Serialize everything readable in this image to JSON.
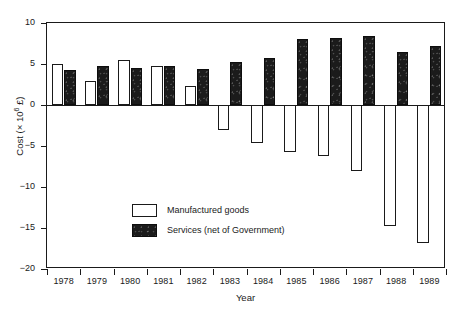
{
  "chart_data": {
    "type": "bar",
    "title": "",
    "subtitle": "",
    "xlabel": "Year",
    "ylabel": "Cost (× 10⁶ £)",
    "ylabel_prefix": "Cost (× 10",
    "ylabel_exponent": "6",
    "ylabel_suffix": " £)",
    "categories": [
      "1978",
      "1979",
      "1980",
      "1981",
      "1982",
      "1983",
      "1984",
      "1985",
      "1986",
      "1987",
      "1988",
      "1989"
    ],
    "series": [
      {
        "name": "Manufactured goods",
        "fill": "#ffffff",
        "edge": "#1a1a1a",
        "values": [
          5.0,
          2.9,
          5.5,
          4.7,
          2.3,
          -3.0,
          -4.6,
          -5.7,
          -6.2,
          -8.0,
          -14.8,
          -16.8
        ]
      },
      {
        "name": "Services (net of Government)",
        "fill": "#1b1b1b",
        "edge": "#0d0d0d",
        "values": [
          4.3,
          4.7,
          4.5,
          4.7,
          4.4,
          5.2,
          5.7,
          8.0,
          8.2,
          8.4,
          6.5,
          7.2
        ]
      }
    ],
    "ylim": [
      -20,
      10
    ],
    "yticks": [
      10,
      5,
      0,
      -5,
      -10,
      -15,
      -20
    ],
    "ytick_labels": [
      "10",
      "5",
      "0",
      "−5",
      "−10",
      "−15",
      "−20"
    ],
    "grid": false,
    "legend_position": "inside-lower-left",
    "zero_line": true,
    "frame": true
  },
  "legend": {
    "entries": [
      {
        "label": "Manufactured goods",
        "swatch": "mfg"
      },
      {
        "label": "Services (net of Government)",
        "swatch": "svc"
      }
    ]
  }
}
